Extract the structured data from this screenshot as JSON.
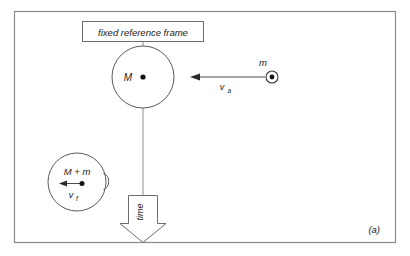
{
  "figure": {
    "panel_label": "(a)",
    "reference_frame_label": "fixed reference frame",
    "time_axis_label": "time",
    "colors": {
      "stroke": "#5a5a5a",
      "frame": "#8a8a8a",
      "text": "#1a1a1a",
      "background": "#ffffff"
    }
  },
  "before_collision": {
    "target_mass_label": "M",
    "projectile_mass_label": "m",
    "projectile_velocity_label": "v",
    "projectile_velocity_subscript": "a"
  },
  "after_collision": {
    "combined_mass_label": "M + m",
    "final_velocity_label": "v",
    "final_velocity_subscript": "f"
  }
}
